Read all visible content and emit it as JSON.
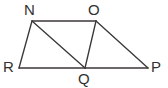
{
  "figure": {
    "background_color": "#ffffff",
    "line_color": "#3b3836",
    "label_color": "#33302f",
    "canvas": {
      "width": 168,
      "height": 88
    },
    "vertices": [
      {
        "id": "N",
        "label": "N",
        "x": 32,
        "y": 21,
        "label_x": 24,
        "label_y": 15
      },
      {
        "id": "O",
        "label": "O",
        "x": 96,
        "y": 21,
        "label_x": 88,
        "label_y": 15
      },
      {
        "id": "R",
        "label": "R",
        "x": 19,
        "y": 68,
        "label_x": 3,
        "label_y": 72
      },
      {
        "id": "Q",
        "label": "Q",
        "x": 85,
        "y": 68,
        "label_x": 78,
        "label_y": 84
      },
      {
        "id": "P",
        "label": "P",
        "x": 148,
        "y": 68,
        "label_x": 151,
        "label_y": 72
      }
    ],
    "edges": [
      {
        "id": "NO",
        "from": "N",
        "to": "O",
        "x1": 32,
        "y1": 21,
        "x2": 96,
        "y2": 21
      },
      {
        "id": "NR",
        "from": "N",
        "to": "R",
        "x1": 32,
        "y1": 21,
        "x2": 19,
        "y2": 68
      },
      {
        "id": "NQ",
        "from": "N",
        "to": "Q",
        "x1": 32,
        "y1": 21,
        "x2": 85,
        "y2": 68
      },
      {
        "id": "OQ",
        "from": "O",
        "to": "Q",
        "x1": 96,
        "y1": 21,
        "x2": 85,
        "y2": 68
      },
      {
        "id": "OP",
        "from": "O",
        "to": "P",
        "x1": 96,
        "y1": 21,
        "x2": 148,
        "y2": 68
      },
      {
        "id": "RQ",
        "from": "R",
        "to": "Q",
        "x1": 19,
        "y1": 68,
        "x2": 85,
        "y2": 68
      },
      {
        "id": "QP",
        "from": "Q",
        "to": "P",
        "x1": 85,
        "y1": 68,
        "x2": 148,
        "y2": 68
      }
    ]
  }
}
